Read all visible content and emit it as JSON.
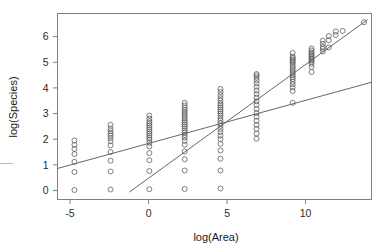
{
  "figure": {
    "type": "scatter-plot",
    "background": "#ffffff"
  },
  "axes": {
    "x_title": "log(Area)",
    "y_title": "log(Species)",
    "x_ticks": [
      "-5",
      "0",
      "5",
      "10"
    ],
    "y_ticks": [
      "0",
      "1",
      "2",
      "3",
      "4",
      "5",
      "6"
    ],
    "frame_color": "#808080",
    "tick_color": "#808080"
  },
  "chart_data": {
    "type": "scatter",
    "title": "",
    "subtitle": "",
    "xlabel": "log(Area)",
    "ylabel": "log(Species)",
    "xlim": [
      -5.8,
      14.2
    ],
    "ylim": [
      -0.35,
      6.9
    ],
    "x_ticks": [
      -5,
      0,
      5,
      10
    ],
    "y_ticks": [
      0,
      1,
      2,
      3,
      4,
      5,
      6
    ],
    "grid": false,
    "legend": null,
    "marker": {
      "shape": "open-circle",
      "size": 3.2,
      "stroke": "#555555",
      "fill": "none"
    },
    "point_columns": [
      {
        "x": -4.72,
        "y": [
          0.02,
          0.72,
          1.12,
          1.42,
          1.62,
          1.78,
          1.95
        ]
      },
      {
        "x": -2.42,
        "y": [
          0.04,
          0.74,
          1.16,
          1.5,
          1.76,
          1.92,
          2.04,
          2.14,
          2.22,
          2.32,
          2.42,
          2.56
        ]
      },
      {
        "x": 0.05,
        "y": [
          0.05,
          0.76,
          1.18,
          1.46,
          1.72,
          1.86,
          1.98,
          2.06,
          2.14,
          2.22,
          2.3,
          2.38,
          2.46,
          2.54,
          2.62,
          2.7,
          2.8,
          2.92
        ]
      },
      {
        "x": 2.3,
        "y": [
          0.06,
          0.78,
          1.22,
          1.52,
          1.78,
          1.94,
          2.06,
          2.16,
          2.26,
          2.34,
          2.42,
          2.5,
          2.58,
          2.66,
          2.74,
          2.82,
          2.9,
          2.98,
          3.06,
          3.14,
          3.22,
          3.32,
          3.42
        ]
      },
      {
        "x": 4.58,
        "y": [
          0.08,
          0.78,
          1.24,
          1.56,
          1.82,
          2.0,
          2.14,
          2.28,
          2.4,
          2.52,
          2.62,
          2.72,
          2.82,
          2.92,
          3.0,
          3.08,
          3.16,
          3.24,
          3.32,
          3.4,
          3.5,
          3.6,
          3.72,
          3.84,
          3.96
        ]
      },
      {
        "x": 6.88,
        "y": [
          2.02,
          2.22,
          2.4,
          2.56,
          2.72,
          2.88,
          3.02,
          3.18,
          3.34,
          3.48,
          3.62,
          3.76,
          3.9,
          4.04,
          4.18,
          4.3,
          4.4,
          4.48,
          4.54
        ]
      },
      {
        "x": 9.18,
        "y": [
          3.42,
          3.88,
          4.02,
          4.14,
          4.24,
          4.34,
          4.42,
          4.5,
          4.58,
          4.66,
          4.74,
          4.82,
          4.9,
          4.98,
          5.04,
          5.1,
          5.16,
          5.22,
          5.36
        ]
      },
      {
        "x": 10.38,
        "y": [
          4.62,
          4.82,
          4.94,
          5.02,
          5.08,
          5.14,
          5.2,
          5.26,
          5.32,
          5.38,
          5.46,
          5.54
        ]
      },
      {
        "x": 11.1,
        "y": [
          5.42,
          5.52,
          5.6,
          5.72,
          5.84
        ]
      },
      {
        "x": 11.48,
        "y": [
          5.58,
          5.86,
          6.02
        ]
      },
      {
        "x": 11.92,
        "y": [
          6.06,
          6.2
        ]
      },
      {
        "x": 12.36,
        "y": [
          6.22
        ]
      },
      {
        "x": 13.72,
        "y": [
          6.56
        ]
      }
    ],
    "lines": [
      {
        "name": "shallow-regression-line",
        "color": "#555555",
        "x1": -5.8,
        "y1": 0.86,
        "x2": 14.2,
        "y2": 4.22
      },
      {
        "name": "steep-regression-line",
        "color": "#555555",
        "x1": -1.22,
        "y1": -0.06,
        "x2": 13.95,
        "y2": 6.66
      }
    ]
  }
}
